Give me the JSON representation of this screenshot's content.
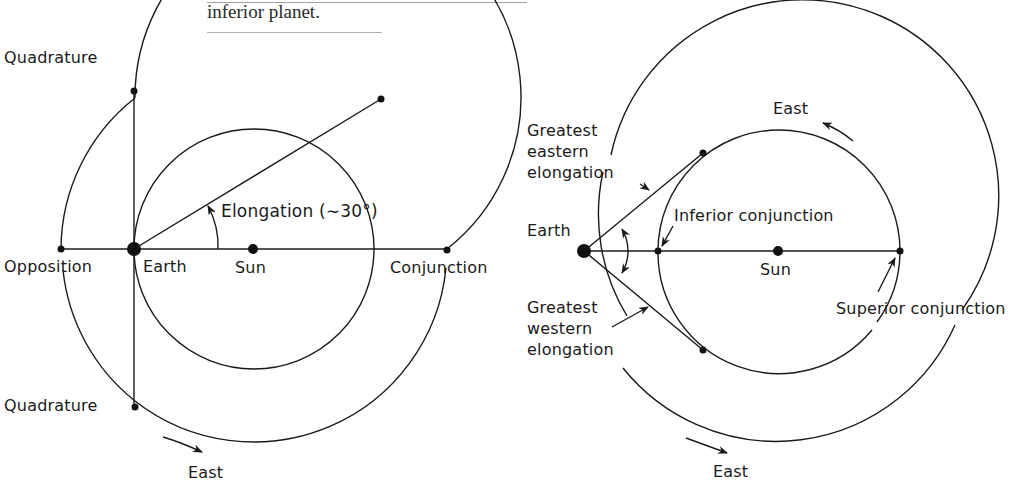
{
  "caption": {
    "text": "inferior planet.",
    "cut_off_line_above": true
  },
  "left_diagram": {
    "title": "Configurations of a superior planet",
    "labels": {
      "quadrature_top": "Quadrature",
      "quadrature_bottom": "Quadrature",
      "opposition": "Opposition",
      "earth": "Earth",
      "sun": "Sun",
      "conjunction": "Conjunction",
      "elongation": "Elongation (∼30°)",
      "east": "East"
    },
    "geometry": {
      "sun_center": [
        254,
        249
      ],
      "outer_orbit_radius": 193,
      "inner_orbit_radius": 120,
      "earth_position": [
        134,
        249
      ],
      "elongation_angle_deg": 30
    }
  },
  "right_diagram": {
    "title": "Configurations of an inferior planet",
    "labels": {
      "greatest_eastern_elongation": "Greatest\neastern\nelongation",
      "greatest_western_elongation": "Greatest\nwestern\nelongation",
      "inferior_conjunction": "Inferior conjunction",
      "superior_conjunction": "Superior conjunction",
      "earth": "Earth",
      "sun": "Sun",
      "east_inner": "East",
      "east_outer": "East"
    },
    "geometry": {
      "sun_center": [
        779,
        251
      ],
      "outer_orbit_radius": 196,
      "inner_orbit_radius": 121,
      "earth_position": [
        584,
        251
      ]
    }
  },
  "colors": {
    "ink": "#1a1a1a",
    "background": "#ffffff"
  }
}
